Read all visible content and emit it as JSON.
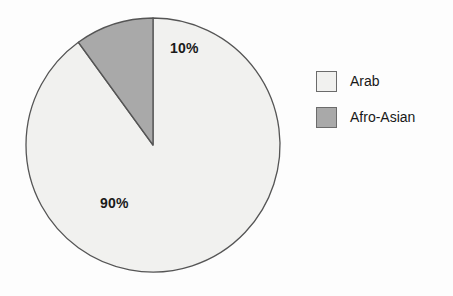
{
  "chart_data": {
    "type": "pie",
    "title": "",
    "subtitle": "",
    "xlabel": "",
    "ylabel": "",
    "grid": false,
    "legend_position": "right",
    "categories": [
      "Arab",
      "Afro-Asian"
    ],
    "values": [
      90,
      10
    ],
    "data_labels": [
      "90%",
      "10%"
    ],
    "colors": [
      "#f1f1ef",
      "#a9a9a9"
    ],
    "start_angle_deg": 0,
    "direction": "clockwise",
    "stroke_color": "#555555",
    "background_color": "#fdfdfd",
    "label_color": "#1a1a1a",
    "slices": [
      {
        "label": "Arab",
        "value": 90,
        "data_label": "90%",
        "color": "#f1f1ef"
      },
      {
        "label": "Afro-Asian",
        "value": 10,
        "data_label": "10%",
        "color": "#a9a9a9"
      }
    ]
  },
  "legend": {
    "items": [
      {
        "label": "Arab",
        "color": "#f1f1ef"
      },
      {
        "label": "Afro-Asian",
        "color": "#a9a9a9"
      }
    ]
  }
}
